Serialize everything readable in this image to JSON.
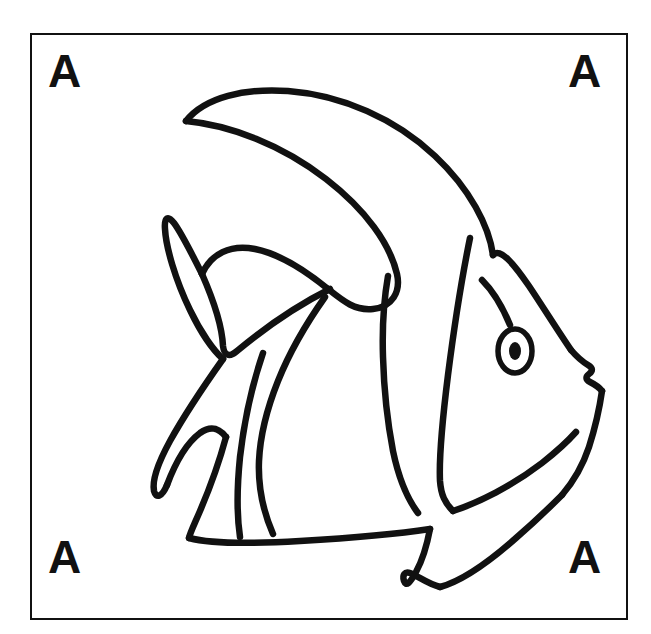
{
  "page": {
    "background_color": "#ffffff",
    "width": 651,
    "height": 634
  },
  "frame": {
    "name": "bounding-box",
    "stroke_color": "#111111",
    "fill_color": "#ffffff",
    "x": 30,
    "y": 33,
    "width": 598,
    "height": 587
  },
  "corner_markers": {
    "top_left": "A",
    "top_right": "A",
    "bottom_left": "A",
    "bottom_right": "A",
    "color": "#111111"
  },
  "artwork": {
    "title": "Angelfish / Moorish Idol outline drawing",
    "style": "black ink line art on white",
    "stroke_color": "#111111",
    "parts": [
      "body-outline",
      "dorsal-filament",
      "tail-fin",
      "pectoral-fin",
      "ventral-fin",
      "anal-fin",
      "eye",
      "pupil",
      "snout-mouth",
      "body-stripe-1",
      "body-stripe-2",
      "body-stripe-3",
      "body-stripe-4"
    ]
  }
}
